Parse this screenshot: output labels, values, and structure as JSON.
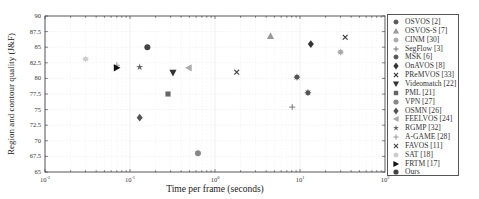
{
  "chart_data": {
    "type": "scatter",
    "title": "",
    "xlabel": "Time per frame (seconds)",
    "ylabel": "Region and contour quality (J&F)",
    "xscale": "log",
    "xlim": [
      0.01,
      100
    ],
    "ylim": [
      65,
      90
    ],
    "grid": true,
    "legend_position": "right, outside",
    "x_ticks": [
      "10^-2",
      "10^-1",
      "10^0",
      "10^1",
      "10^2"
    ],
    "y_ticks": [
      "65",
      "67.5",
      "70",
      "72.5",
      "75",
      "77.5",
      "80",
      "82.5",
      "85",
      "87.5",
      "90"
    ],
    "series": [
      {
        "name": "OSVOS [2]",
        "marker": "asterisk",
        "color": "#555555",
        "x": 12.4,
        "y": 77.7
      },
      {
        "name": "OSVOS-S [7]",
        "marker": "triangle-up",
        "color": "#999999",
        "x": 4.5,
        "y": 86.8
      },
      {
        "name": "CINM [30]",
        "marker": "asterisk",
        "color": "#aaaaaa",
        "x": 30,
        "y": 84.2
      },
      {
        "name": "SegFlow [3]",
        "marker": "plus",
        "color": "#777777",
        "x": 8.1,
        "y": 75.4
      },
      {
        "name": "MSK [6]",
        "marker": "asterisk",
        "color": "#555555",
        "x": 9.2,
        "y": 80.2
      },
      {
        "name": "OnAVOS [8]",
        "marker": "diamond",
        "color": "#333333",
        "x": 13.4,
        "y": 85.5
      },
      {
        "name": "PReMVOS [33]",
        "marker": "x",
        "color": "#333333",
        "x": 34,
        "y": 86.6
      },
      {
        "name": "Videomatch [22]",
        "marker": "triangle-down",
        "color": "#333333",
        "x": 0.32,
        "y": 80.9
      },
      {
        "name": "PML [21]",
        "marker": "square",
        "color": "#666666",
        "x": 0.28,
        "y": 77.5
      },
      {
        "name": "VPN [27]",
        "marker": "circle",
        "color": "#888888",
        "x": 0.63,
        "y": 68.0
      },
      {
        "name": "OSMN [26]",
        "marker": "diamond",
        "color": "#555555",
        "x": 0.13,
        "y": 73.7
      },
      {
        "name": "FEELVOS [24]",
        "marker": "triangle-left",
        "color": "#aaaaaa",
        "x": 0.49,
        "y": 81.7
      },
      {
        "name": "RGMP [32]",
        "marker": "star",
        "color": "#666666",
        "x": 0.13,
        "y": 81.8
      },
      {
        "name": "A-GAME [28]",
        "marker": "plus",
        "color": "#999999",
        "x": 0.07,
        "y": 82.1
      },
      {
        "name": "FAVOS [11]",
        "marker": "x",
        "color": "#444444",
        "x": 1.8,
        "y": 81.0
      },
      {
        "name": "SAT [18]",
        "marker": "asterisk",
        "color": "#cccccc",
        "x": 0.03,
        "y": 83.1
      },
      {
        "name": "FRTM [17]",
        "marker": "triangle-right",
        "color": "#111111",
        "x": 0.07,
        "y": 81.7
      },
      {
        "name": "Ours",
        "marker": "circle",
        "color": "#444444",
        "x": 0.16,
        "y": 85.0
      }
    ]
  },
  "axis": {
    "xlabel": "Time per frame (seconds)",
    "ylabel": "Region and contour quality (J&F)"
  }
}
